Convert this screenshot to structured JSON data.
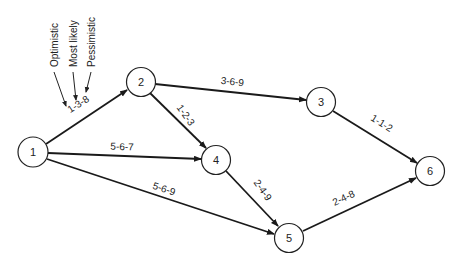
{
  "diagram": {
    "type": "PERT activity network",
    "nodes": [
      {
        "id": "1",
        "label": "1",
        "x": 33,
        "y": 152
      },
      {
        "id": "2",
        "label": "2",
        "x": 141,
        "y": 82
      },
      {
        "id": "3",
        "label": "3",
        "x": 321,
        "y": 102
      },
      {
        "id": "4",
        "label": "4",
        "x": 216,
        "y": 160
      },
      {
        "id": "5",
        "label": "5",
        "x": 289,
        "y": 238
      },
      {
        "id": "6",
        "label": "6",
        "x": 430,
        "y": 171
      }
    ],
    "edges": [
      {
        "from": "1",
        "to": "2",
        "label": "1-3-8"
      },
      {
        "from": "1",
        "to": "4",
        "label": "5-6-7"
      },
      {
        "from": "1",
        "to": "5",
        "label": "5-6-9"
      },
      {
        "from": "2",
        "to": "3",
        "label": "3-6-9"
      },
      {
        "from": "2",
        "to": "4",
        "label": "1-2-3"
      },
      {
        "from": "3",
        "to": "6",
        "label": "1-1-2"
      },
      {
        "from": "4",
        "to": "5",
        "label": "2-4-9"
      },
      {
        "from": "5",
        "to": "6",
        "label": "2-4-8"
      }
    ],
    "legend": {
      "optimistic": "Optimistic",
      "most_likely": "Most likely",
      "pessimistic": "Pessimistic"
    }
  }
}
